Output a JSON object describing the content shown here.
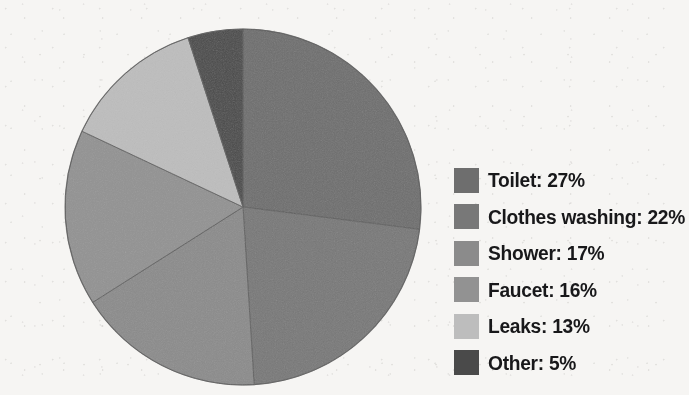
{
  "chart_data": {
    "type": "pie",
    "title": "",
    "subtitle": "",
    "xlabel": "",
    "ylabel": "",
    "legend_position": "right",
    "grid": false,
    "start_angle_deg": 0,
    "direction": "clockwise",
    "categories": [
      "Toilet",
      "Clothes washing",
      "Shower",
      "Faucet",
      "Leaks",
      "Other"
    ],
    "values": [
      27,
      22,
      17,
      16,
      13,
      5
    ],
    "unit": "%",
    "slices": [
      {
        "label": "Toilet",
        "value": 27,
        "display": "Toilet: 27%",
        "color": "#6e6e6e"
      },
      {
        "label": "Clothes washing",
        "value": 22,
        "display": "Clothes washing: 22%",
        "color": "#787878"
      },
      {
        "label": "Shower",
        "value": 17,
        "display": "Shower: 17%",
        "color": "#8b8b8b"
      },
      {
        "label": "Faucet",
        "value": 16,
        "display": "Faucet: 16%",
        "color": "#929292"
      },
      {
        "label": "Leaks",
        "value": 13,
        "display": "Leaks: 13%",
        "color": "#bdbdbd"
      },
      {
        "label": "Other",
        "value": 5,
        "display": "Other: 5%",
        "color": "#4a4a4a"
      }
    ]
  },
  "pie": {
    "center_x": 203,
    "center_y": 191,
    "radius": 178,
    "edge_color": "#5c5c5c",
    "background_color": "#f6f5f3"
  },
  "legend": {
    "items": [
      {
        "label": "Toilet: 27%",
        "color": "#6e6e6e"
      },
      {
        "label": "Clothes washing: 22%",
        "color": "#787878"
      },
      {
        "label": "Shower: 17%",
        "color": "#8b8b8b"
      },
      {
        "label": "Faucet: 16%",
        "color": "#929292"
      },
      {
        "label": "Leaks: 13%",
        "color": "#bdbdbd"
      },
      {
        "label": "Other: 5%",
        "color": "#4a4a4a"
      }
    ]
  }
}
